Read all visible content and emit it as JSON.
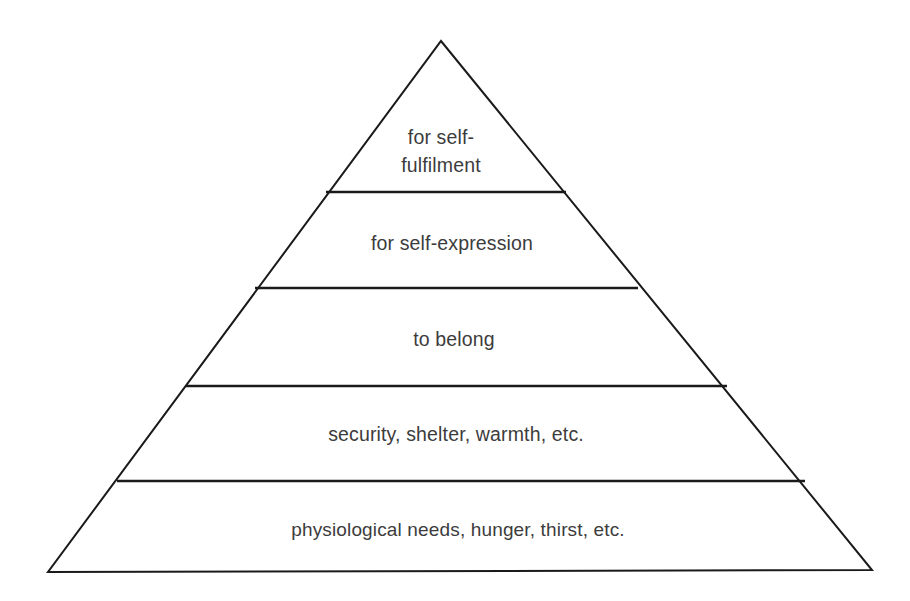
{
  "diagram": {
    "type": "pyramid",
    "background_color": "#ffffff",
    "stroke_color": "#1a1a1a",
    "text_color": "#3c3c3c",
    "stroke_width": 2,
    "apex": {
      "x": 441,
      "y": 41
    },
    "base_left": {
      "x": 48,
      "y": 572
    },
    "base_right": {
      "x": 872,
      "y": 570
    },
    "tiers": [
      {
        "index": 1,
        "position": "top",
        "label": "for self-fulfilment",
        "label_lines": [
          "for self-",
          "fulfilment"
        ],
        "divider_y": 192,
        "divider_x_start": 326,
        "divider_x_end": 566,
        "text_center_x": 441,
        "text_baseline_y": 144
      },
      {
        "index": 2,
        "position": "second",
        "label": "for self-expression",
        "label_lines": [
          "for self-expression"
        ],
        "divider_y": 288,
        "divider_x_start": 255,
        "divider_x_end": 638,
        "text_center_x": 452,
        "text_baseline_y": 250
      },
      {
        "index": 3,
        "position": "middle",
        "label": "to belong",
        "label_lines": [
          "to belong"
        ],
        "divider_y": 386,
        "divider_x_start": 186,
        "divider_x_end": 727,
        "text_center_x": 454,
        "text_baseline_y": 346
      },
      {
        "index": 4,
        "position": "fourth",
        "label": "security, shelter, warmth, etc.",
        "label_lines": [
          "security, shelter, warmth, etc."
        ],
        "divider_y": 481,
        "divider_x_start": 117,
        "divider_x_end": 805,
        "text_center_x": 456,
        "text_baseline_y": 441
      },
      {
        "index": 5,
        "position": "base",
        "label": "physiological needs, hunger, thirst, etc.",
        "label_lines": [
          "physiological needs, hunger, thirst, etc."
        ],
        "divider_y": null,
        "divider_x_start": null,
        "divider_x_end": null,
        "text_center_x": 458,
        "text_baseline_y": 536
      }
    ]
  }
}
